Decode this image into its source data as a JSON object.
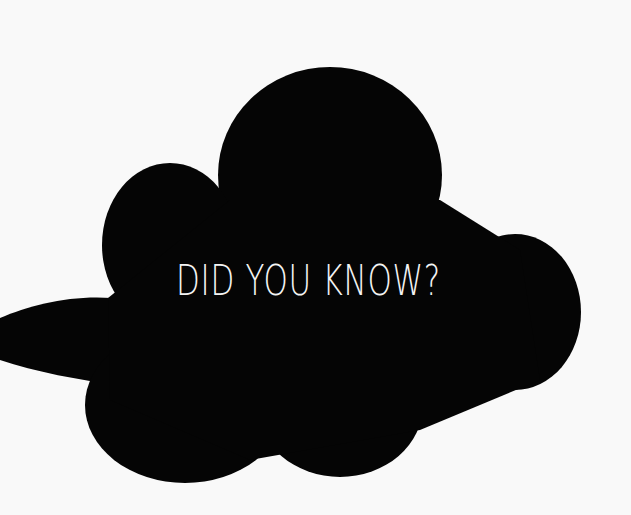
{
  "speech_bubble": {
    "text": "DID YOU KNOW?",
    "fill_color": "#050505",
    "text_color": "#f4f4f4"
  },
  "background_color": "#f9f9f9"
}
